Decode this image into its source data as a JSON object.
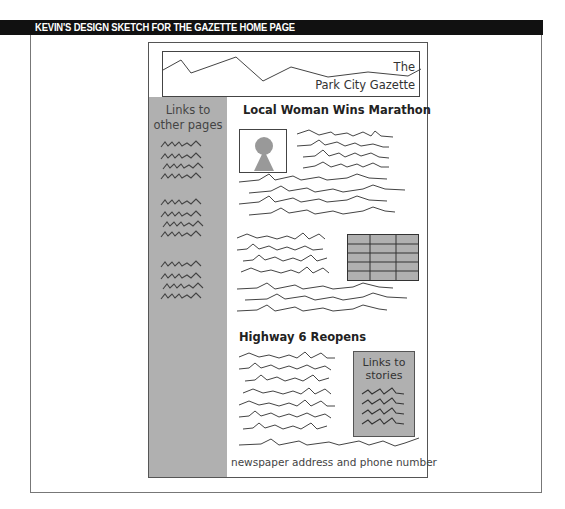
{
  "header": {
    "title": "KEVIN'S DESIGN SKETCH FOR THE GAZETTE HOME PAGE",
    "bar_color": "#111111"
  },
  "sketch": {
    "banner": {
      "line1": "The",
      "line2": "Park City Gazette",
      "graphic": "mountain-line-icon"
    },
    "sidebar": {
      "title_line1": "Links to",
      "title_line2": "other pages",
      "link_groups": [
        4,
        4,
        4
      ],
      "color": "#b0b0b0"
    },
    "story1": {
      "headline": "Local Woman Wins Marathon",
      "photo": "person-photo-placeholder",
      "table": {
        "rows": 5,
        "cols": 3
      }
    },
    "story2": {
      "headline": "Highway 6 Reopens",
      "links_box": {
        "title_line1": "Links to",
        "title_line2": "stories",
        "links": 4
      }
    },
    "footer": {
      "text": "newspaper address and phone number"
    }
  }
}
